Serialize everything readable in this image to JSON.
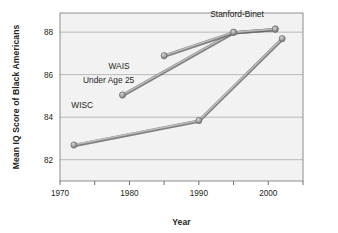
{
  "chart_data": {
    "type": "line",
    "title": "",
    "xlabel": "Year",
    "ylabel": "Mean IQ Score of Black Americans",
    "xlim": [
      1970,
      2005
    ],
    "ylim": [
      81.0,
      88.9
    ],
    "xticks": [
      1970,
      1980,
      1990,
      2000
    ],
    "xtick_labels": [
      "1970",
      "1980",
      "1990",
      "2000"
    ],
    "xminor_ticks": [
      1975,
      1985,
      1995,
      2005
    ],
    "yticks": [
      82,
      84,
      86,
      88
    ],
    "ytick_labels": [
      "82",
      "84",
      "86",
      "88"
    ],
    "grid": "horizontal",
    "legend": "inline-annotations",
    "marker": "circle",
    "line_color": "#8a8a8a",
    "marker_color": "#9a9a9a",
    "grid_color": "#b9b9b9",
    "series": [
      {
        "name": "WISC",
        "label": "WISC",
        "label_x": 1973.2,
        "label_y": 84.45,
        "points": [
          {
            "x": 1972,
            "y": 82.7
          },
          {
            "x": 1990,
            "y": 83.85
          },
          {
            "x": 2002,
            "y": 87.7
          }
        ]
      },
      {
        "name": "WAIS Under Age 25",
        "label": "WAIS",
        "label2": "Under Age 25",
        "label_x": 1978.5,
        "label_y": 86.25,
        "label2_x": 1977.0,
        "label2_y": 85.62,
        "points": [
          {
            "x": 1979,
            "y": 85.05
          },
          {
            "x": 1995,
            "y": 88.0
          },
          {
            "x": 2001,
            "y": 88.15
          }
        ]
      },
      {
        "name": "Stanford-Binet",
        "label": "Stanford-Binet",
        "label_x": 1995.5,
        "label_y": 88.72,
        "points": [
          {
            "x": 1985,
            "y": 86.9
          },
          {
            "x": 1995,
            "y": 88.0
          },
          {
            "x": 2001,
            "y": 88.15
          }
        ]
      }
    ]
  },
  "axes": {
    "x_title": "Year",
    "y_title": "Mean IQ Score of Black Americans"
  }
}
